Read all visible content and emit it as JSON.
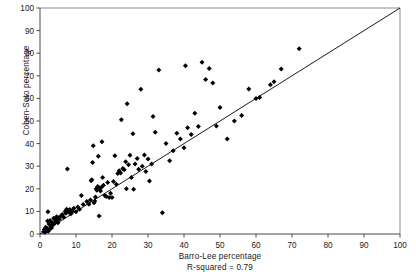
{
  "chart_data": {
    "type": "scatter",
    "title": "",
    "xlabel": "Barro-Lee percentage",
    "ylabel": "Cohen-Soto percentage",
    "annotation": "R-squared = 0.79",
    "xlim": [
      0,
      100
    ],
    "ylim": [
      0,
      100
    ],
    "xticks": [
      0,
      10,
      20,
      30,
      40,
      50,
      60,
      70,
      80,
      90,
      100
    ],
    "yticks": [
      0,
      10,
      20,
      30,
      40,
      50,
      60,
      70,
      80,
      90,
      100
    ],
    "grid": false,
    "legend": null,
    "marker": "diamond",
    "marker_color": "#000000",
    "reference_line": {
      "kind": "identity",
      "label": "45-degree line",
      "from": [
        0,
        0
      ],
      "to": [
        100,
        100
      ],
      "color": "#000000"
    },
    "points": [
      [
        1.0,
        1.0
      ],
      [
        1.2,
        2.0
      ],
      [
        1.4,
        0.8
      ],
      [
        1.6,
        3.0
      ],
      [
        1.8,
        1.6
      ],
      [
        2.0,
        2.4
      ],
      [
        2.1,
        5.8
      ],
      [
        2.3,
        1.2
      ],
      [
        2.5,
        4.4
      ],
      [
        2.6,
        2.0
      ],
      [
        2.8,
        6.0
      ],
      [
        3.0,
        3.4
      ],
      [
        3.2,
        2.6
      ],
      [
        3.4,
        5.0
      ],
      [
        3.6,
        4.0
      ],
      [
        3.8,
        7.0
      ],
      [
        4.0,
        4.6
      ],
      [
        4.2,
        6.4
      ],
      [
        4.4,
        5.4
      ],
      [
        4.6,
        7.6
      ],
      [
        4.8,
        6.2
      ],
      [
        5.0,
        5.0
      ],
      [
        5.2,
        7.2
      ],
      [
        5.4,
        6.6
      ],
      [
        5.8,
        8.0
      ],
      [
        2.2,
        9.8
      ],
      [
        6.2,
        8.6
      ],
      [
        6.6,
        7.4
      ],
      [
        7.0,
        10.0
      ],
      [
        7.2,
        9.2
      ],
      [
        7.4,
        11.0
      ],
      [
        7.6,
        28.8
      ],
      [
        7.8,
        10.4
      ],
      [
        8.0,
        9.6
      ],
      [
        8.3,
        10.8
      ],
      [
        8.6,
        9.0
      ],
      [
        9.0,
        10.2
      ],
      [
        9.4,
        11.4
      ],
      [
        10.0,
        9.8
      ],
      [
        10.5,
        12.0
      ],
      [
        11.0,
        11.0
      ],
      [
        11.5,
        17.0
      ],
      [
        12.0,
        13.0
      ],
      [
        13.0,
        14.4
      ],
      [
        13.6,
        13.2
      ],
      [
        14.0,
        15.0
      ],
      [
        14.2,
        23.6
      ],
      [
        14.4,
        24.0
      ],
      [
        14.6,
        31.6
      ],
      [
        14.8,
        39.0
      ],
      [
        15.0,
        13.8
      ],
      [
        15.2,
        14.6
      ],
      [
        15.4,
        16.4
      ],
      [
        15.6,
        20.0
      ],
      [
        15.8,
        19.4
      ],
      [
        16.0,
        21.0
      ],
      [
        16.2,
        34.4
      ],
      [
        16.4,
        8.0
      ],
      [
        16.6,
        20.4
      ],
      [
        16.8,
        19.0
      ],
      [
        17.0,
        20.6
      ],
      [
        17.2,
        40.8
      ],
      [
        17.4,
        25.0
      ],
      [
        17.6,
        21.6
      ],
      [
        18.0,
        17.0
      ],
      [
        18.4,
        16.6
      ],
      [
        18.8,
        22.8
      ],
      [
        19.2,
        16.2
      ],
      [
        19.6,
        18.0
      ],
      [
        20.0,
        16.2
      ],
      [
        20.4,
        23.2
      ],
      [
        20.8,
        34.6
      ],
      [
        21.2,
        22.0
      ],
      [
        21.6,
        26.8
      ],
      [
        22.0,
        28.0
      ],
      [
        22.4,
        27.0
      ],
      [
        22.6,
        50.6
      ],
      [
        23.0,
        29.0
      ],
      [
        23.4,
        28.4
      ],
      [
        23.8,
        32.0
      ],
      [
        24.0,
        20.0
      ],
      [
        24.2,
        57.6
      ],
      [
        24.6,
        30.6
      ],
      [
        25.0,
        34.8
      ],
      [
        25.4,
        25.0
      ],
      [
        25.8,
        44.4
      ],
      [
        26.0,
        19.8
      ],
      [
        26.4,
        31.0
      ],
      [
        27.0,
        33.4
      ],
      [
        27.4,
        28.6
      ],
      [
        28.0,
        64.0
      ],
      [
        28.4,
        30.0
      ],
      [
        29.0,
        35.0
      ],
      [
        29.4,
        27.6
      ],
      [
        30.0,
        33.2
      ],
      [
        30.4,
        23.4
      ],
      [
        31.0,
        31.0
      ],
      [
        31.4,
        52.0
      ],
      [
        32.0,
        45.0
      ],
      [
        33.0,
        72.6
      ],
      [
        34.0,
        9.4
      ],
      [
        35.0,
        40.0
      ],
      [
        36.0,
        32.4
      ],
      [
        37.0,
        36.8
      ],
      [
        38.0,
        44.6
      ],
      [
        39.0,
        42.0
      ],
      [
        40.0,
        38.2
      ],
      [
        40.4,
        74.4
      ],
      [
        41.0,
        47.0
      ],
      [
        42.0,
        44.0
      ],
      [
        43.0,
        53.4
      ],
      [
        44.0,
        47.6
      ],
      [
        45.0,
        76.0
      ],
      [
        46.0,
        68.4
      ],
      [
        47.0,
        73.2
      ],
      [
        48.0,
        66.8
      ],
      [
        49.0,
        47.8
      ],
      [
        50.0,
        56.0
      ],
      [
        52.0,
        42.0
      ],
      [
        54.0,
        50.0
      ],
      [
        56.0,
        52.4
      ],
      [
        58.0,
        64.2
      ],
      [
        60.0,
        60.0
      ],
      [
        61.0,
        60.4
      ],
      [
        64.0,
        66.0
      ],
      [
        65.0,
        67.4
      ],
      [
        67.0,
        73.0
      ],
      [
        72.0,
        82.0
      ]
    ]
  }
}
